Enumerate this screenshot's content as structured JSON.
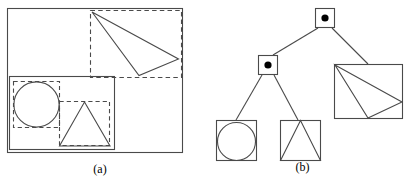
{
  "figure": {
    "width": 405,
    "height": 184,
    "background": "#ffffff",
    "stroke_color": "#4a4a4a",
    "dash_color": "#4a4a4a",
    "dot_color": "#000000"
  },
  "panels": [
    {
      "id": "a",
      "caption": "(a)",
      "description": "Scene with nested solid grouping boxes and dashed bounding boxes around primitives",
      "shapes": {
        "outer_box": {
          "x": 7,
          "y": 8,
          "w": 175,
          "h": 144,
          "style": "solid"
        },
        "dashed_top_right": {
          "x": 90,
          "y": 10,
          "w": 91,
          "h": 67,
          "style": "dashed"
        },
        "triangle_top_right": {
          "points": "92,12 178,59 139,75",
          "style": "solid"
        },
        "group_box_lower_left": {
          "x": 9,
          "y": 76,
          "w": 105,
          "h": 73,
          "style": "solid"
        },
        "dashed_circle_box": {
          "x": 13,
          "y": 81,
          "w": 47,
          "h": 47,
          "style": "dashed"
        },
        "circle": {
          "cx": 36,
          "cy": 104,
          "r": 23,
          "style": "solid"
        },
        "dashed_triangle_box": {
          "x": 59,
          "y": 101,
          "w": 51,
          "h": 45,
          "style": "dashed"
        },
        "triangle_lower": {
          "points": "84,102 110,146 60,146",
          "style": "solid"
        }
      }
    },
    {
      "id": "b",
      "caption": "(b)",
      "description": "Scene tree: root internal node with two children; left child internal node has circle and triangle leaves; right child is a triangle leaf",
      "nodes": [
        {
          "name": "root-node",
          "type": "internal",
          "x": 115,
          "y": 8,
          "w": 20,
          "h": 20,
          "dot_r": 3.6
        },
        {
          "name": "left-internal-node",
          "type": "internal",
          "x": 58,
          "y": 55,
          "w": 20,
          "h": 20,
          "dot_r": 3.6
        },
        {
          "name": "circle-leaf",
          "type": "leaf",
          "x": 16,
          "y": 120,
          "w": 40,
          "h": 40,
          "content": "circle"
        },
        {
          "name": "triangle-leaf",
          "type": "leaf",
          "x": 31,
          "y": 120,
          "w": 40,
          "h": 40,
          "content": "triangle"
        },
        {
          "name": "big-triangle-leaf",
          "type": "leaf",
          "x": 134,
          "y": 64,
          "w": 68,
          "h": 54,
          "content": "triangle"
        }
      ],
      "edges": [
        {
          "name": "edge-root-to-left",
          "from": "root-node",
          "to": "left-internal-node"
        },
        {
          "name": "edge-root-to-right",
          "from": "root-node",
          "to": "big-triangle-leaf"
        },
        {
          "name": "edge-left-to-circle",
          "from": "left-internal-node",
          "to": "circle-leaf"
        },
        {
          "name": "edge-left-to-tri",
          "from": "left-internal-node",
          "to": "triangle-leaf"
        }
      ]
    }
  ]
}
